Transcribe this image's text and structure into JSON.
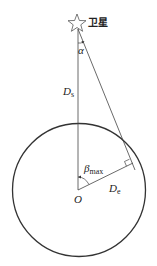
{
  "diagram": {
    "satellite_label": "卫星",
    "alpha_label": "α",
    "ds_label": "D",
    "ds_sub": "s",
    "beta_label": "β",
    "beta_sub": "max",
    "de_label": "D",
    "de_sub": "e",
    "origin_label": "O",
    "stroke_color": "#333333"
  }
}
